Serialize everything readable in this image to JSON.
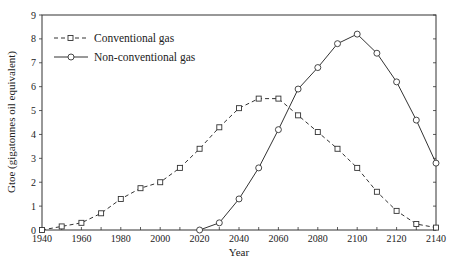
{
  "chart_data": {
    "type": "line",
    "title": "",
    "xlabel": "Year",
    "ylabel": "Gtoe (gigatonnes oil equivalent)",
    "xlim": [
      1940,
      2140
    ],
    "ylim": [
      0,
      9
    ],
    "xticks": [
      1940,
      1960,
      1980,
      2000,
      2020,
      2040,
      2060,
      2080,
      2100,
      2120,
      2140
    ],
    "yticks": [
      0,
      1,
      2,
      3,
      4,
      5,
      6,
      7,
      8,
      9
    ],
    "grid": false,
    "legend_position": "top-left",
    "series": [
      {
        "name": "Conventional gas",
        "style": "dashed",
        "marker": "square",
        "x": [
          1940,
          1950,
          1960,
          1970,
          1980,
          1990,
          2000,
          2010,
          2020,
          2030,
          2040,
          2050,
          2060,
          2070,
          2080,
          2090,
          2100,
          2110,
          2120,
          2130,
          2140
        ],
        "values": [
          0,
          0.15,
          0.3,
          0.7,
          1.3,
          1.75,
          2.0,
          2.6,
          3.4,
          4.3,
          5.1,
          5.5,
          5.5,
          4.8,
          4.1,
          3.4,
          2.6,
          1.6,
          0.8,
          0.25,
          0.1
        ]
      },
      {
        "name": "Non-conventional gas",
        "style": "solid",
        "marker": "circle",
        "x": [
          2020,
          2030,
          2040,
          2050,
          2060,
          2070,
          2080,
          2090,
          2100,
          2110,
          2120,
          2130,
          2140
        ],
        "values": [
          0,
          0.3,
          1.3,
          2.6,
          4.2,
          5.9,
          6.8,
          7.8,
          8.2,
          7.4,
          6.2,
          4.6,
          2.8
        ]
      }
    ]
  }
}
